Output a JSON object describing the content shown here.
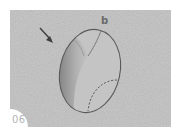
{
  "figure": {
    "step_number": "06",
    "point_label": "b",
    "icons": {
      "arrow": "arrow-down-right-icon"
    },
    "colors": {
      "background": "#ffffff",
      "paper": "#c9c9c9",
      "shading_dark": "#6f6f6f",
      "outline": "#555555",
      "step_number": "#b5b5b5"
    }
  }
}
